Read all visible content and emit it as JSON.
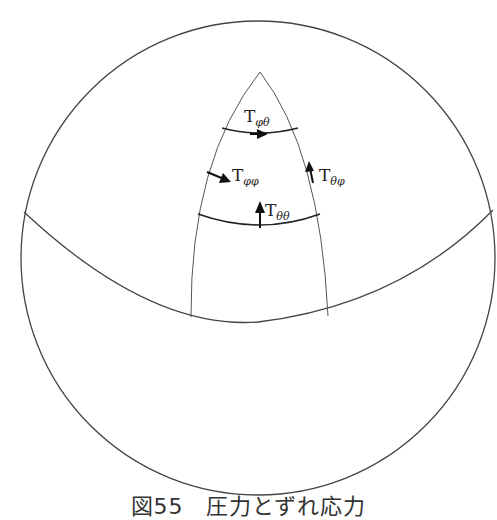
{
  "figure": {
    "caption": "図55　圧力とずれ応力",
    "colors": {
      "line": "#444444",
      "background": "#ffffff"
    },
    "labels": [
      {
        "id": "t-phi-theta",
        "main": "T",
        "sub": "φθ"
      },
      {
        "id": "t-phi-phi",
        "main": "T",
        "sub": "φφ"
      },
      {
        "id": "t-theta-phi",
        "main": "T",
        "sub": "θφ"
      },
      {
        "id": "t-theta-theta",
        "main": "T",
        "sub": "θθ"
      }
    ]
  }
}
